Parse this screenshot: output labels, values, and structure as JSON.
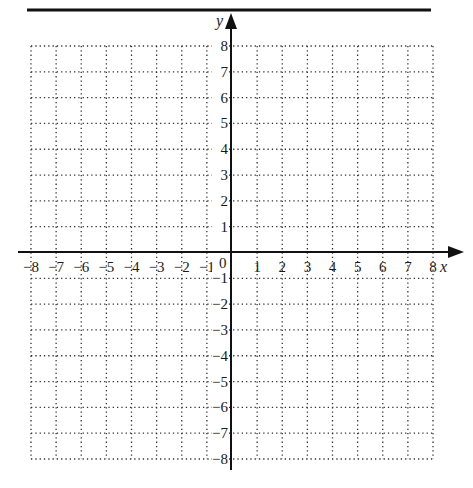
{
  "diagram": {
    "type": "coordinate-plane",
    "x_axis": {
      "label": "x",
      "min": -8,
      "max": 8,
      "step": 1,
      "tick_labels": [
        "−8",
        "−7",
        "−6",
        "−5",
        "−4",
        "−3",
        "−2",
        "−1",
        "1",
        "2",
        "3",
        "4",
        "5",
        "6",
        "7",
        "8"
      ]
    },
    "y_axis": {
      "label": "y",
      "min": -8,
      "max": 8,
      "step": 1,
      "tick_labels": [
        "8",
        "7",
        "6",
        "5",
        "4",
        "3",
        "2",
        "1",
        "−1",
        "−2",
        "−3",
        "−4",
        "−5",
        "−6",
        "−7",
        "−8"
      ]
    },
    "origin_label": "0",
    "grid": {
      "style": "dotted",
      "color": "#333333"
    },
    "axis_color": "#111111",
    "top_rule_color": "#111111"
  },
  "chart_data": {
    "type": "scatter",
    "title": "",
    "xlabel": "x",
    "ylabel": "y",
    "xlim": [
      -8,
      8
    ],
    "ylim": [
      -8,
      8
    ],
    "grid": true,
    "x_ticks": [
      -8,
      -7,
      -6,
      -5,
      -4,
      -3,
      -2,
      -1,
      0,
      1,
      2,
      3,
      4,
      5,
      6,
      7,
      8
    ],
    "y_ticks": [
      -8,
      -7,
      -6,
      -5,
      -4,
      -3,
      -2,
      -1,
      0,
      1,
      2,
      3,
      4,
      5,
      6,
      7,
      8
    ],
    "series": []
  }
}
